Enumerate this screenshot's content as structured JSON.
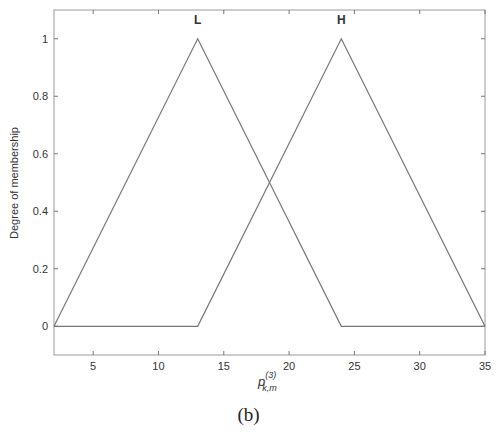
{
  "caption": "(b)",
  "chart_data": {
    "type": "line",
    "title": "",
    "xlabel": "p_{k,m}^{(3)}",
    "xlabel_base": "p",
    "xlabel_sup": "(3)",
    "xlabel_sub": "k,m",
    "ylabel": "Degree of membership",
    "xlim": [
      2,
      35
    ],
    "ylim": [
      -0.1,
      1.1
    ],
    "xticks": [
      5,
      10,
      15,
      20,
      25,
      30,
      35
    ],
    "yticks": [
      0,
      0.2,
      0.4,
      0.6,
      0.8,
      1
    ],
    "ytick_labels": [
      "0",
      "0.2",
      "0.4",
      "0.6",
      "0.8",
      "1"
    ],
    "grid": false,
    "legend": "none; series labeled above peaks",
    "series": [
      {
        "name": "L",
        "x": [
          2,
          13,
          24,
          35
        ],
        "y": [
          0,
          1,
          0,
          0
        ]
      },
      {
        "name": "H",
        "x": [
          2,
          13,
          24,
          35
        ],
        "y": [
          0,
          0,
          1,
          0
        ]
      }
    ],
    "line_color": "#777777"
  }
}
